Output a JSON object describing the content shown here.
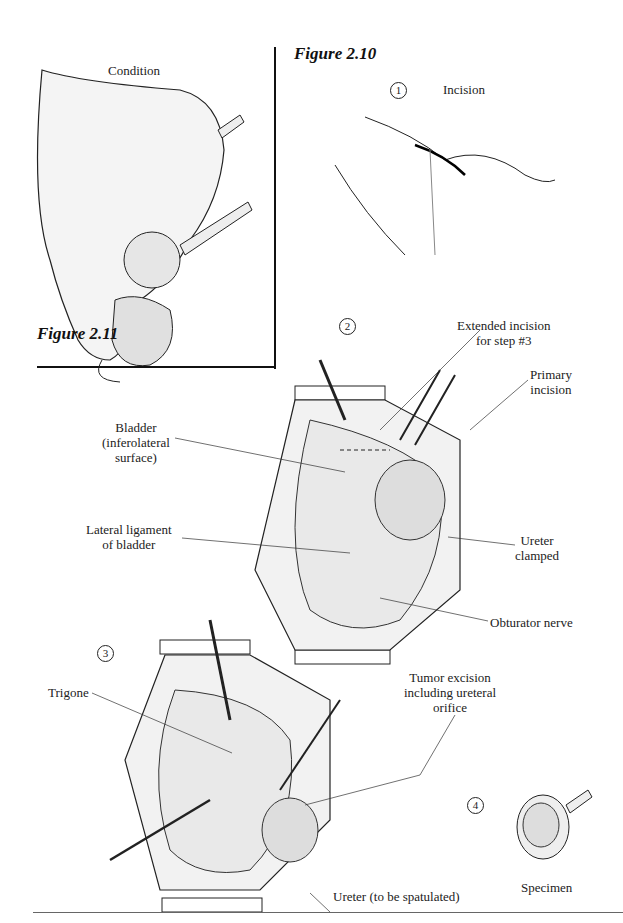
{
  "figures": {
    "fig_2_10": "Figure 2.10",
    "fig_2_11": "Figure 2.11"
  },
  "condition_panel": {
    "title": "Condition"
  },
  "steps": [
    {
      "number": "1",
      "title": "Incision"
    },
    {
      "number": "2",
      "title": ""
    },
    {
      "number": "3",
      "title": ""
    },
    {
      "number": "4",
      "title": ""
    }
  ],
  "step2_labels": {
    "extended_incision_1": "Extended incision",
    "extended_incision_2": "for step #3",
    "primary_incision_1": "Primary",
    "primary_incision_2": "incision",
    "bladder_1": "Bladder",
    "bladder_2": "(inferolateral",
    "bladder_3": "surface)",
    "lateral_ligament_1": "Lateral ligament",
    "lateral_ligament_2": "of bladder",
    "ureter_clamped_1": "Ureter",
    "ureter_clamped_2": "clamped",
    "obturator_nerve": "Obturator nerve"
  },
  "step3_labels": {
    "trigone": "Trigone",
    "tumor_excision_1": "Tumor excision",
    "tumor_excision_2": "including ureteral",
    "tumor_excision_3": "orifice",
    "ureter": "Ureter (to be spatulated)"
  },
  "step4_labels": {
    "specimen": "Specimen"
  }
}
